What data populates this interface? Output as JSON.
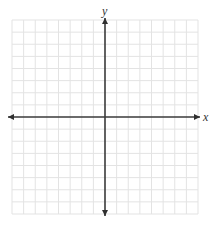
{
  "diagram": {
    "type": "coordinate-plane",
    "x_axis_label": "x",
    "y_axis_label": "y",
    "grid": {
      "x_range": [
        -8,
        8
      ],
      "y_range": [
        -8,
        8
      ],
      "step": 1
    },
    "axes_arrows": "both-ends",
    "colors": {
      "grid": "#e3e3e3",
      "axis": "#3a3a3a",
      "background": "#ffffff"
    }
  }
}
